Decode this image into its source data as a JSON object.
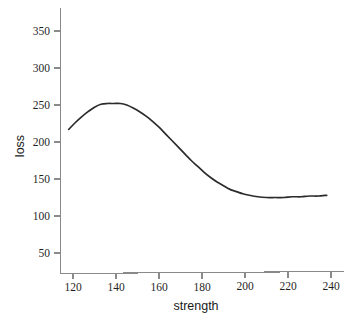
{
  "chart_data": {
    "type": "line",
    "title": "",
    "subtitle": "",
    "xlabel": "strength",
    "ylabel": "loss",
    "xlim": [
      115,
      240
    ],
    "ylim": [
      25,
      368
    ],
    "grid": false,
    "legend": false,
    "legend_position": "none",
    "xticks": [
      120,
      140,
      160,
      180,
      200,
      220,
      240
    ],
    "xticklabels": [
      "120",
      "140",
      "160",
      "180",
      "200",
      "220",
      "240"
    ],
    "yticks": [
      50,
      100,
      150,
      200,
      250,
      300,
      350
    ],
    "yticklabels": [
      "50",
      "100",
      "150",
      "200",
      "250",
      "300",
      "350"
    ],
    "series": [
      {
        "name": "loss",
        "color": "#2b2b2b",
        "x": [
          118,
          121,
          124,
          127,
          130,
          133,
          136,
          139,
          142,
          145,
          148,
          151,
          154,
          157,
          160,
          163,
          166,
          169,
          172,
          175,
          178,
          181,
          184,
          187,
          190,
          193,
          196,
          199,
          202,
          206,
          210,
          214,
          218,
          222,
          226,
          230,
          234,
          238
        ],
        "y": [
          217,
          226,
          234,
          241,
          247,
          251,
          252,
          252,
          252,
          250,
          246,
          241,
          235,
          228,
          220,
          211,
          202,
          193,
          184,
          175,
          167,
          159,
          152,
          146,
          141,
          136,
          133,
          130,
          128,
          126,
          125,
          125,
          125,
          126,
          126,
          127,
          127,
          128
        ]
      }
    ],
    "annotations": []
  },
  "axes": {
    "x_axis_name": "x-axis",
    "y_axis_name": "y-axis"
  }
}
